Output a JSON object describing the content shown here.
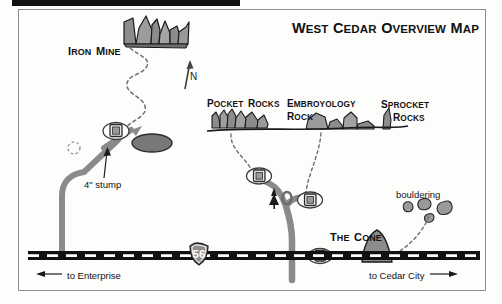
{
  "document": {
    "kind": "climbing-area-overview-map",
    "title_parts": [
      {
        "big": "W",
        "small": "EST"
      },
      {
        "big": "C",
        "small": "EDAR"
      },
      {
        "big": "O",
        "small": "VERVIEW"
      },
      {
        "big": "M",
        "small": "AP"
      }
    ],
    "title_plain": "West Cedar Overview Map"
  },
  "colors": {
    "ink": "#111111",
    "rock_fill": "#8c8c8c",
    "rock_fill_light": "#a9a9a9",
    "road_gray": "#7d7d7d",
    "highway_black": "#111111",
    "paper": "#fdfdfc",
    "frame": "#8d8d8d"
  },
  "header_bar": {
    "name": "black-header-bar",
    "x": 12,
    "y": 0,
    "width": 228,
    "height": 6
  },
  "compass": {
    "label": "N",
    "arrow": "north-arrow"
  },
  "features": [
    {
      "id": "iron-mine",
      "label_parts": [
        {
          "big": "I",
          "small": "RON"
        },
        {
          "big": "M",
          "small": "INE"
        }
      ],
      "label_plain": "Iron Mine",
      "type": "rock-formation"
    },
    {
      "id": "pocket-rocks",
      "label_parts": [
        {
          "big": "P",
          "small": "OCKET"
        },
        {
          "big": "R",
          "small": "OCKS"
        }
      ],
      "label_plain": "Pocket Rocks",
      "type": "rock-formation"
    },
    {
      "id": "embryology-rock",
      "label_line1_parts": [
        {
          "big": "E",
          "small": "MBROYOLOGY"
        }
      ],
      "label_line2_parts": [
        {
          "big": "R",
          "small": "OCK"
        }
      ],
      "label_plain": "Embroyology Rock",
      "type": "rock-formation"
    },
    {
      "id": "sprocket-rocks",
      "label_line1_parts": [
        {
          "big": "S",
          "small": "PROCKET"
        }
      ],
      "label_line2_parts": [
        {
          "big": "R",
          "small": "OCKS"
        }
      ],
      "label_plain": "Sprocket Rocks",
      "type": "rock-formation"
    },
    {
      "id": "the-cone",
      "label_parts": [
        {
          "big": "T",
          "small": "HE"
        },
        {
          "big": "C",
          "small": "ONE"
        }
      ],
      "label_plain": "The Cone",
      "type": "rock-formation"
    }
  ],
  "annotations": {
    "stump": "4\" stump",
    "bouldering": "bouldering"
  },
  "highway": {
    "shield_number": "56",
    "shield_type": "interstate-shield",
    "direction_west": "to Enterprise",
    "direction_east": "to Cedar City"
  },
  "markers": {
    "parking_count": 3,
    "parking_icon": "parking-marker-icon",
    "tree_icon": "pine-tree-icon",
    "pond_icon": "pond-ellipse"
  }
}
